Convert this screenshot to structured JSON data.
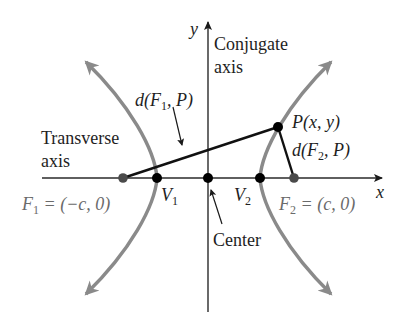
{
  "diagram": {
    "type": "hyperbola",
    "axes": {
      "x_label": "x",
      "y_label": "y"
    },
    "labels": {
      "conjugate_axis_line1": "Conjugate",
      "conjugate_axis_line2": "axis",
      "transverse_axis_line1": "Transverse",
      "transverse_axis_line2": "axis",
      "center": "Center",
      "d_f1_p_pre": "d(F",
      "d_f1_p_sub": "1",
      "d_f1_p_post": ", P)",
      "d_f2_p_pre": "d(F",
      "d_f2_p_sub": "2",
      "d_f2_p_post": ", P)",
      "point_p": "P(x, y)",
      "v1_main": "V",
      "v1_sub": "1",
      "v2_main": "V",
      "v2_sub": "2",
      "f1_main": "F",
      "f1_sub": "1",
      "f1_eq": " = (−c, 0)",
      "f2_main": "F",
      "f2_sub": "2",
      "f2_eq": " = (c, 0)"
    },
    "points": [
      {
        "name": "F1",
        "coords": "(-c, 0)"
      },
      {
        "name": "V1"
      },
      {
        "name": "Center"
      },
      {
        "name": "V2"
      },
      {
        "name": "F2",
        "coords": "(c, 0)"
      },
      {
        "name": "P",
        "coords": "(x, y)"
      }
    ],
    "colors": {
      "curve": "#8a8a8a",
      "axis": "#2a2a2a",
      "segment": "#111111",
      "focus_label": "#6a6a6a",
      "text": "#1e1e1e"
    }
  }
}
